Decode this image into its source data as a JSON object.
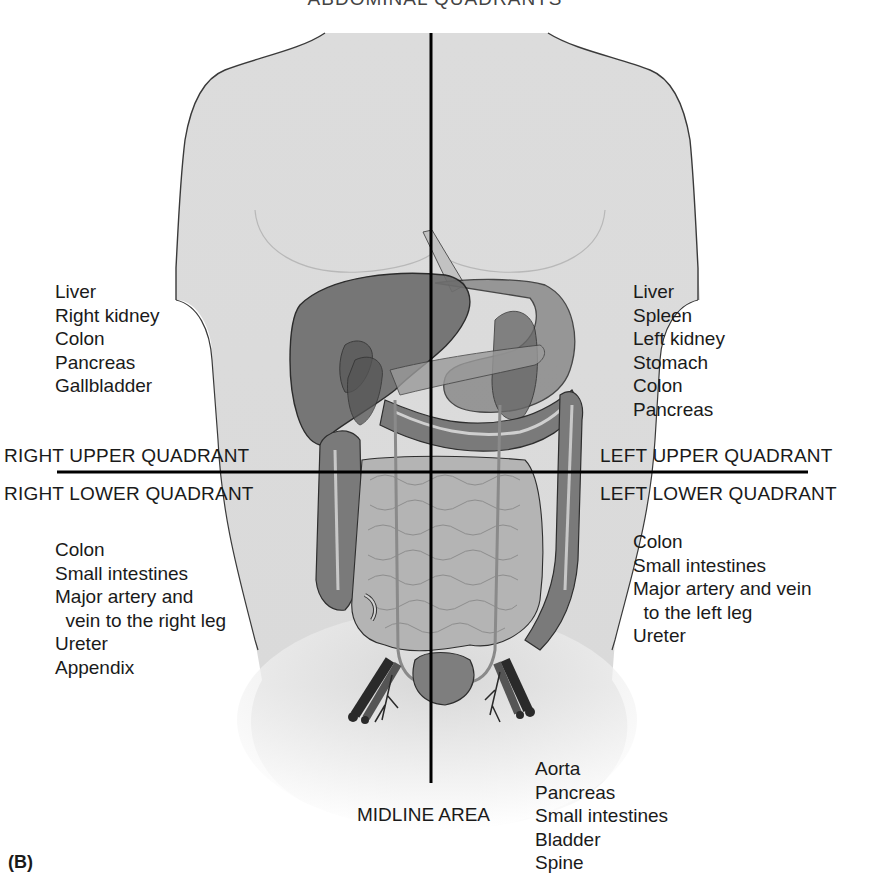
{
  "figure": {
    "title": "ABDOMINAL QUADRANTS",
    "panel_label": "(B)",
    "colors": {
      "skin": "#dcdcdc",
      "skin_outline": "#3a3a3a",
      "liver": "#6e6e6e",
      "stomach": "#8a8a8a",
      "colon": "#7a7a7a",
      "small_intestine": "#b4b4b4",
      "vessels": "#4a4a4a",
      "axis_lines": "#000000"
    }
  },
  "quadrants": {
    "right_upper": {
      "label": "RIGHT UPPER QUADRANT",
      "organs": [
        "Liver",
        "Right kidney",
        "Colon",
        "Pancreas",
        "Gallbladder"
      ]
    },
    "left_upper": {
      "label": "LEFT UPPER QUADRANT",
      "organs": [
        "Liver",
        "Spleen",
        "Left kidney",
        "Stomach",
        "Colon",
        "Pancreas"
      ]
    },
    "right_lower": {
      "label": "RIGHT LOWER QUADRANT",
      "organs": [
        "Colon",
        "Small intestines",
        "Major artery and",
        "  vein to the right leg",
        "Ureter",
        "Appendix"
      ]
    },
    "left_lower": {
      "label": "LEFT LOWER QUADRANT",
      "organs": [
        "Colon",
        "Small intestines",
        "Major artery and vein",
        "  to the left leg",
        "Ureter"
      ]
    }
  },
  "midline": {
    "label": "MIDLINE AREA",
    "organs": [
      "Aorta",
      "Pancreas",
      "Small intestines",
      "Bladder",
      "Spine"
    ]
  }
}
